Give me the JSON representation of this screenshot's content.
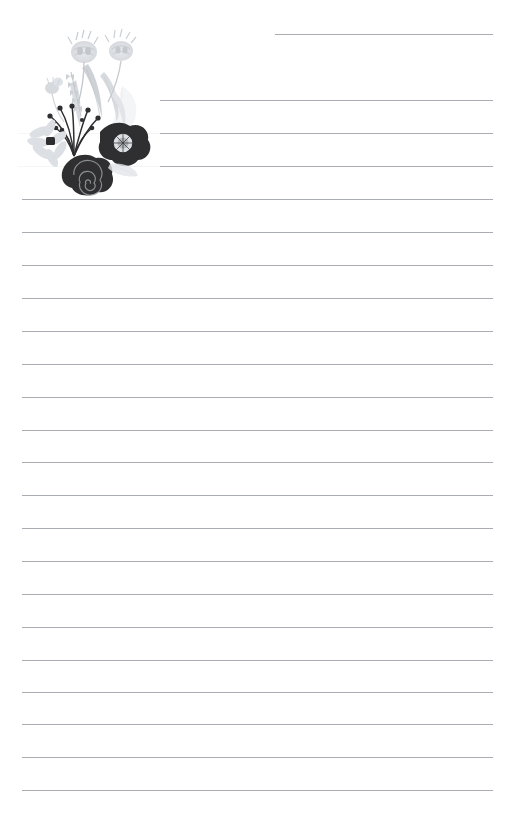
{
  "document": {
    "kind": "lined-stationery-page",
    "title": "Floral Lined Notepaper",
    "width": 515,
    "height": 820,
    "paper_color": "#ffffff",
    "line_color": "#a9acb0",
    "line_count": 23,
    "line_spacing": 33,
    "writing_area": {
      "left": 22,
      "right": 493
    }
  },
  "artwork": {
    "name": "floral-corner-bouquet",
    "description": "Monochrome bouquet: gray thistle blooms and leaves above, dark poppy with pale center, dark spiral rose, pale daisy with dark center, and a spray of berry-tipped stems.",
    "palette": {
      "dark": "#2f2f31",
      "dark_soft": "#3a3a3d",
      "mid_gray": "#b9bcc0",
      "light_gray": "#d3d6da",
      "pale_gray": "#e6e8eb",
      "very_pale": "#f1f2f4",
      "center_pale": "#dcdfe3"
    },
    "elements": [
      {
        "name": "thistle-bloom-left",
        "tone": "light_gray"
      },
      {
        "name": "thistle-bloom-right",
        "tone": "light_gray"
      },
      {
        "name": "wheat-sprig",
        "tone": "light_gray"
      },
      {
        "name": "leaf-blade-tall",
        "tone": "light_gray"
      },
      {
        "name": "leaf-blade-curved",
        "tone": "pale_gray"
      },
      {
        "name": "leaf-blade-wide",
        "tone": "very_pale"
      },
      {
        "name": "berry-stem-spray",
        "tone": "dark"
      },
      {
        "name": "poppy-flower",
        "tone": "dark"
      },
      {
        "name": "spiral-rose",
        "tone": "dark"
      },
      {
        "name": "daisy-flower",
        "tone": "light_gray"
      },
      {
        "name": "shadow-leaf",
        "tone": "very_pale"
      }
    ]
  },
  "lines": [
    {
      "id": 1,
      "y": 34,
      "x1": 275,
      "x2": 493,
      "faint": false
    },
    {
      "id": 2,
      "y": 100,
      "x1": 160,
      "x2": 493,
      "faint": false
    },
    {
      "id": 3,
      "y": 133,
      "x1": 160,
      "x2": 493,
      "faint": false
    },
    {
      "id": 4,
      "y": 133,
      "x1": 18,
      "x2": 160,
      "faint": true
    },
    {
      "id": 5,
      "y": 166,
      "x1": 160,
      "x2": 493,
      "faint": false
    },
    {
      "id": 6,
      "y": 166,
      "x1": 18,
      "x2": 160,
      "faint": true
    },
    {
      "id": 7,
      "y": 199,
      "x1": 22,
      "x2": 493,
      "faint": false
    },
    {
      "id": 8,
      "y": 232,
      "x1": 22,
      "x2": 493,
      "faint": false
    },
    {
      "id": 9,
      "y": 265,
      "x1": 22,
      "x2": 493,
      "faint": false
    },
    {
      "id": 10,
      "y": 298,
      "x1": 22,
      "x2": 493,
      "faint": false
    },
    {
      "id": 11,
      "y": 331,
      "x1": 22,
      "x2": 493,
      "faint": false
    },
    {
      "id": 12,
      "y": 364,
      "x1": 22,
      "x2": 493,
      "faint": false
    },
    {
      "id": 13,
      "y": 397,
      "x1": 22,
      "x2": 493,
      "faint": false
    },
    {
      "id": 14,
      "y": 430,
      "x1": 22,
      "x2": 493,
      "faint": false
    },
    {
      "id": 15,
      "y": 462,
      "x1": 22,
      "x2": 493,
      "faint": false
    },
    {
      "id": 16,
      "y": 495,
      "x1": 22,
      "x2": 493,
      "faint": false
    },
    {
      "id": 17,
      "y": 528,
      "x1": 22,
      "x2": 493,
      "faint": false
    },
    {
      "id": 18,
      "y": 561,
      "x1": 22,
      "x2": 493,
      "faint": false
    },
    {
      "id": 19,
      "y": 594,
      "x1": 22,
      "x2": 493,
      "faint": false
    },
    {
      "id": 20,
      "y": 627,
      "x1": 22,
      "x2": 493,
      "faint": false
    },
    {
      "id": 21,
      "y": 660,
      "x1": 22,
      "x2": 493,
      "faint": false
    },
    {
      "id": 22,
      "y": 692,
      "x1": 22,
      "x2": 493,
      "faint": false
    },
    {
      "id": 23,
      "y": 724,
      "x1": 22,
      "x2": 493,
      "faint": false
    },
    {
      "id": 24,
      "y": 757,
      "x1": 22,
      "x2": 493,
      "faint": false
    },
    {
      "id": 25,
      "y": 790,
      "x1": 22,
      "x2": 493,
      "faint": false
    }
  ]
}
